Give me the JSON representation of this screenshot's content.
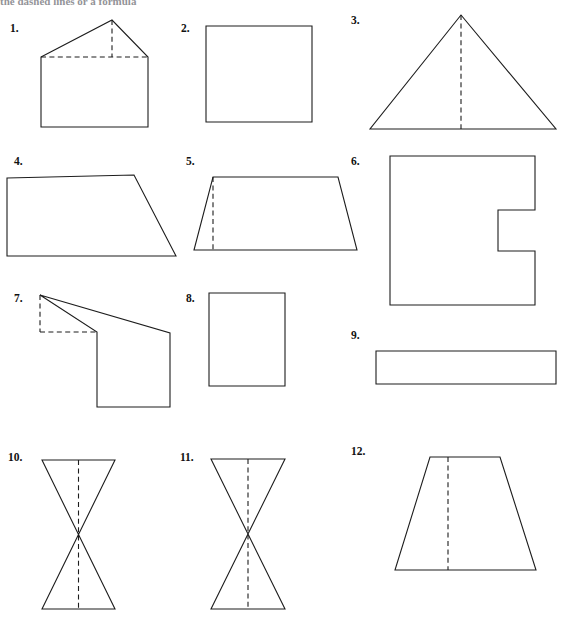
{
  "page": {
    "header_text_partial": "the dashed lines or a formula",
    "background_color": "#ffffff",
    "ink_color": "#1d1d1d",
    "width": 561,
    "height": 620
  },
  "figures": [
    {
      "id": "figure-1",
      "number": "1.",
      "name": "pentagon-house",
      "description": "Pentagon shaped like a house with dashed base of roof and dashed altitude",
      "label_x": 10,
      "label_y": 32,
      "outline": "M41,57 L112,20 L148,57 L148,127 L41,127 Z",
      "dashed": [
        "M41,57 L148,57",
        "M112,20 L112,57"
      ]
    },
    {
      "id": "figure-2",
      "number": "2.",
      "name": "rectangle-square",
      "description": "Plain rectangle close to a square",
      "label_x": 181,
      "label_y": 32,
      "outline": "M206,26 L312,26 L312,122 L206,122 Z",
      "dashed": []
    },
    {
      "id": "figure-3",
      "number": "3.",
      "name": "triangle-with-altitude",
      "description": "Isosceles triangle with dashed vertical altitude",
      "label_x": 351,
      "label_y": 24,
      "outline": "M461,15 L556,129 L370,129 Z",
      "dashed": [
        "M461,15 L461,129"
      ]
    },
    {
      "id": "figure-4",
      "number": "4.",
      "name": "right-trapezoid",
      "description": "Right trapezoid, slanted right side",
      "label_x": 14,
      "label_y": 165,
      "outline": "M7,178 L134,175 L176,256 L7,256 Z",
      "dashed": []
    },
    {
      "id": "figure-5",
      "number": "5.",
      "name": "trapezoid-with-height",
      "description": "Trapezoid with dashed vertical height near left vertex",
      "label_x": 186,
      "label_y": 165,
      "outline": "M213,177 L338,177 L357,250 L194,250 Z",
      "dashed": [
        "M213,177 L213,250"
      ]
    },
    {
      "id": "figure-6",
      "number": "6.",
      "name": "notched-square-c-shape",
      "description": "Square with rectangular notch cut into the right side forming a C",
      "label_x": 351,
      "label_y": 165,
      "outline": "M390,156 L535,156 L535,210 L498,210 L498,251 L535,251 L535,305 L390,305 Z",
      "dashed": []
    },
    {
      "id": "figure-7",
      "number": "7.",
      "name": "composite-polygon-with-dashed-rectangle",
      "description": "Composite polygon: apex at top left with solid edges and dashed rectangle legs",
      "label_x": 14,
      "label_y": 302,
      "outline": "M40,295 L170,333 L170,407 L97,407 L97,332 Z",
      "dashed": [
        "M40,295 L40,332",
        "M40,332 L97,332"
      ]
    },
    {
      "id": "figure-8",
      "number": "8.",
      "name": "tall-rectangle",
      "description": "Tall upright rectangle",
      "label_x": 186,
      "label_y": 302,
      "outline": "M209,293 L285,293 L285,386 L209,386 Z",
      "dashed": []
    },
    {
      "id": "figure-9",
      "number": "9.",
      "name": "wide-flat-rectangle",
      "description": "Wide flat rectangle",
      "label_x": 351,
      "label_y": 339,
      "outline": "M376,351 L556,351 L556,384 L376,384 Z",
      "dashed": []
    },
    {
      "id": "figure-10",
      "number": "10.",
      "name": "symmetric-bowtie",
      "description": "Symmetric hourglass / bowtie of two triangles with dashed vertical axis",
      "label_x": 8,
      "label_y": 461,
      "outline": "M42,460 L115,460 L42,609 L115,609 Z",
      "dashed": [
        "M78.5,460 L78.5,609"
      ]
    },
    {
      "id": "figure-11",
      "number": "11.",
      "name": "asymmetric-bowtie",
      "description": "Asymmetric bowtie with a small top triangle and large bottom triangle, dashed vertical axis",
      "label_x": 180,
      "label_y": 461,
      "outline": "M211,459 L285,459 L211,609 L285,609 Z",
      "dashed": [
        "M248,459 L248,609"
      ]
    },
    {
      "id": "figure-12",
      "number": "12.",
      "name": "trapezoid-with-dashed-height",
      "description": "Isosceles trapezoid with dashed vertical height line",
      "label_x": 351,
      "label_y": 455,
      "outline": "M430,457 L500,457 L536,570 L395,570 Z",
      "dashed": [
        "M448,457 L448,570"
      ]
    }
  ]
}
